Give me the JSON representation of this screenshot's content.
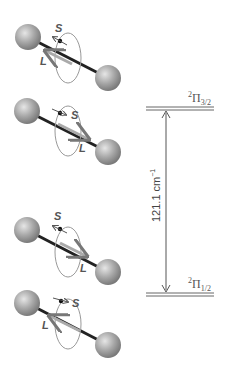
{
  "diagram": {
    "molecules": [
      {
        "id": 1,
        "spin_label": "S",
        "orbital_label": "L",
        "s_direction": "antiparallel-to-axis",
        "l_direction": "toward-left-atom",
        "state": "2Pi3/2"
      },
      {
        "id": 2,
        "spin_label": "S",
        "orbital_label": "L",
        "s_direction": "parallel-to-axis",
        "l_direction": "toward-right-atom",
        "state": "2Pi3/2"
      },
      {
        "id": 3,
        "spin_label": "S",
        "orbital_label": "L",
        "s_direction": "antiparallel-to-axis",
        "l_direction": "toward-right-atom",
        "state": "2Pi1/2"
      },
      {
        "id": 4,
        "spin_label": "S",
        "orbital_label": "L",
        "s_direction": "parallel-to-axis",
        "l_direction": "toward-left-atom",
        "state": "2Pi1/2"
      }
    ],
    "levels": {
      "upper": {
        "multiplicity": "2",
        "symbol": "Π",
        "subscript": "3/2"
      },
      "lower": {
        "multiplicity": "2",
        "symbol": "Π",
        "subscript": "1/2"
      }
    },
    "splitting": {
      "value": "121.1",
      "unit": "cm",
      "exponent": "−1"
    },
    "colors": {
      "sphere": "#9a9a9a",
      "bond": "#222222",
      "orbit": "#888888",
      "level_line": "#666666",
      "text": "#555555"
    }
  }
}
